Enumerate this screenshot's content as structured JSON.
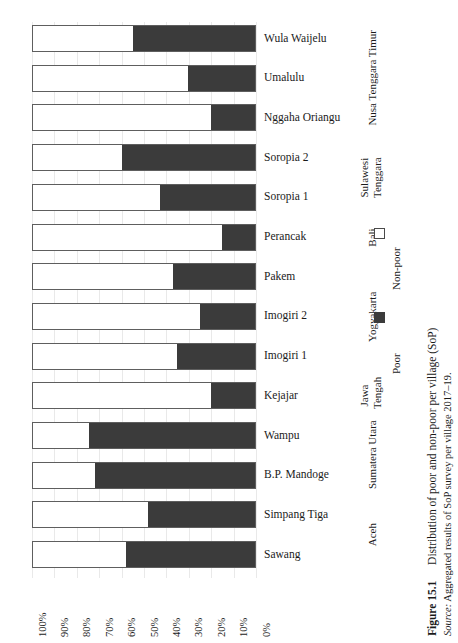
{
  "chart_data": {
    "type": "bar",
    "orientation": "horizontal",
    "stacked": true,
    "stack_mode": "percent",
    "title": "Distribution of poor and non-poor per village (SoP)",
    "figure_number": "Figure 15.1",
    "source": "Aggregated results of SoP survey per village 2017–19.",
    "source_label": "Source:",
    "xlabel": "",
    "ylabel": "",
    "xlim": [
      100,
      0
    ],
    "x_axis_reversed": true,
    "grid": true,
    "legend_position": "right",
    "categories": [
      "Wula Waijelu",
      "Umalulu",
      "Nggaha Oriangu",
      "Soropia 2",
      "Soropia 1",
      "Perancak",
      "Pakem",
      "Imogiri 2",
      "Imogiri 1",
      "Kejajar",
      "Wampu",
      "B.P. Mandoge",
      "Simpang Tiga",
      "Sawang"
    ],
    "xticks": [
      "100%",
      "90%",
      "80%",
      "70%",
      "60%",
      "50%",
      "40%",
      "30%",
      "20%",
      "10%",
      "0%"
    ],
    "xtick_values": [
      100,
      90,
      80,
      70,
      60,
      50,
      40,
      30,
      20,
      10,
      0
    ],
    "series": [
      {
        "name": "Non-poor",
        "color": "#ffffff",
        "values": [
          45,
          70,
          80,
          40,
          57,
          85,
          63,
          75,
          65,
          80,
          25,
          28,
          52,
          42
        ]
      },
      {
        "name": "Poor",
        "color": "#3b3b3b",
        "values": [
          55,
          30,
          20,
          60,
          43,
          15,
          37,
          25,
          35,
          20,
          75,
          72,
          48,
          58
        ]
      }
    ],
    "group_labels": [
      {
        "label": "Nusa Tenggara Timur",
        "categories": [
          "Wula Waijelu",
          "Umalulu",
          "Nggaha Oriangu"
        ]
      },
      {
        "label": "Sulawesi Tenggara",
        "categories": [
          "Soropia 2",
          "Soropia 1"
        ]
      },
      {
        "label": "Bali",
        "categories": [
          "Perancak"
        ]
      },
      {
        "label": "Yogyakarta",
        "categories": [
          "Pakem",
          "Imogiri 2",
          "Imogiri 1"
        ]
      },
      {
        "label": "Jawa Tengah",
        "categories": [
          "Kejajar"
        ]
      },
      {
        "label": "Sumatera Utara",
        "categories": [
          "Wampu",
          "B.P. Mandoge"
        ]
      },
      {
        "label": "Aceh",
        "categories": [
          "Simpang Tiga",
          "Sawang"
        ]
      }
    ]
  },
  "legend": {
    "entries": [
      {
        "label": "Non-poor",
        "swatch": "white"
      },
      {
        "label": "Poor",
        "swatch": "dark"
      }
    ]
  },
  "villages": [
    {
      "name": "Wula Waijelu",
      "poor": 55,
      "non_poor": 45
    },
    {
      "name": "Umalulu",
      "poor": 30,
      "non_poor": 70
    },
    {
      "name": "Nggaha Oriangu",
      "poor": 20,
      "non_poor": 80
    },
    {
      "name": "Soropia 2",
      "poor": 60,
      "non_poor": 40
    },
    {
      "name": "Soropia 1",
      "poor": 43,
      "non_poor": 57
    },
    {
      "name": "Perancak",
      "poor": 15,
      "non_poor": 85
    },
    {
      "name": "Pakem",
      "poor": 37,
      "non_poor": 63
    },
    {
      "name": "Imogiri 2",
      "poor": 25,
      "non_poor": 75
    },
    {
      "name": "Imogiri 1",
      "poor": 35,
      "non_poor": 65
    },
    {
      "name": "Kejajar",
      "poor": 20,
      "non_poor": 80
    },
    {
      "name": "Wampu",
      "poor": 75,
      "non_poor": 25
    },
    {
      "name": "B.P. Mandoge",
      "poor": 72,
      "non_poor": 28
    },
    {
      "name": "Simpang Tiga",
      "poor": 48,
      "non_poor": 52
    },
    {
      "name": "Sawang",
      "poor": 58,
      "non_poor": 42
    }
  ],
  "provinces": [
    {
      "label": "Nusa Tenggara Timur",
      "start_index": 0,
      "end_index": 2,
      "two_line": false
    },
    {
      "label": "Sulawesi Tenggara",
      "start_index": 3,
      "end_index": 4,
      "two_line": true
    },
    {
      "label": "Bali",
      "start_index": 5,
      "end_index": 5,
      "two_line": false
    },
    {
      "label": "Yogyakarta",
      "start_index": 6,
      "end_index": 8,
      "two_line": false
    },
    {
      "label": "Jawa Tengah",
      "start_index": 9,
      "end_index": 9,
      "two_line": true
    },
    {
      "label": "Sumatera Utara",
      "start_index": 10,
      "end_index": 11,
      "two_line": false
    },
    {
      "label": "Aceh",
      "start_index": 12,
      "end_index": 13,
      "two_line": false
    }
  ],
  "caption": {
    "figure_number": "Figure 15.1",
    "text": "Distribution of poor and non-poor per village (SoP)",
    "source_label": "Source:",
    "source_text": "Aggregated results of SoP survey per village 2017–19."
  },
  "colors": {
    "poor": "#3b3b3b",
    "non_poor": "#ffffff",
    "bar_border": "#5e5e5e",
    "gridline": "#e9e9e9",
    "text": "#1a1a1a"
  }
}
